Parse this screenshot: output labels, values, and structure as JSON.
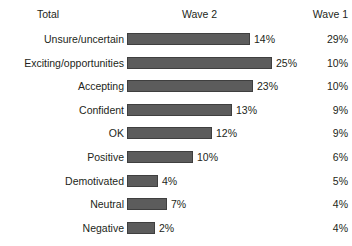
{
  "header": {
    "total_label": "Total",
    "wave2_label": "Wave 2",
    "wave1_label": "Wave 1"
  },
  "chart_data": {
    "type": "bar",
    "orientation": "horizontal",
    "title": "",
    "xlabel": "",
    "ylabel": "",
    "grid": false,
    "legend": "none",
    "bar_color": "#5c5c5c",
    "background": "#ffffff",
    "columns": [
      "Total",
      "Wave 2",
      "Wave 1"
    ],
    "categories": [
      "Unsure/uncertain",
      "Exciting/opportunities",
      "Accepting",
      "Confident",
      "OK",
      "Positive",
      "Demotivated",
      "Neutral",
      "Negative"
    ],
    "series": [
      {
        "name": "Wave 2",
        "values": [
          14,
          25,
          23,
          13,
          12,
          10,
          4,
          7,
          2
        ],
        "labels": [
          "14%",
          "25%",
          "23%",
          "13%",
          "12%",
          "10%",
          "4%",
          "7%",
          "2%"
        ],
        "bar_px": [
          123,
          145,
          126,
          105,
          85,
          66,
          31,
          40,
          28
        ]
      },
      {
        "name": "Wave 1",
        "values": [
          29,
          10,
          10,
          9,
          9,
          6,
          5,
          4,
          4
        ],
        "labels": [
          "29%",
          "10%",
          "10%",
          "9%",
          "9%",
          "6%",
          "5%",
          "4%",
          "4%"
        ]
      }
    ]
  }
}
